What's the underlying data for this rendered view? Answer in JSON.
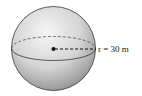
{
  "figure": {
    "type": "sphere",
    "radius_label": "r = 30 m",
    "colors": {
      "outline": "#333333",
      "shade_light": "#f4f4f4",
      "shade_dark": "#8c8c8c"
    }
  }
}
